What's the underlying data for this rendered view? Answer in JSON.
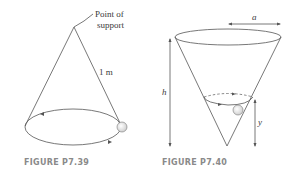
{
  "figures": [
    {
      "caption": "FIGURE P7.39",
      "labels": {
        "support": [
          "Point of",
          "support"
        ],
        "length": "1 m"
      },
      "description": "Conical pendulum: ball on string from point of support moving in horizontal circle"
    },
    {
      "caption": "FIGURE P7.40",
      "labels": {
        "radius": "a",
        "height": "h",
        "level": "y"
      },
      "description": "Ball moving in horizontal circle inside inverted cone of top radius a and height h, at height y above apex"
    }
  ],
  "colors": {
    "line": "#555555",
    "caption": "#8a8a8a",
    "ball_fill": "#e6e6e6"
  }
}
